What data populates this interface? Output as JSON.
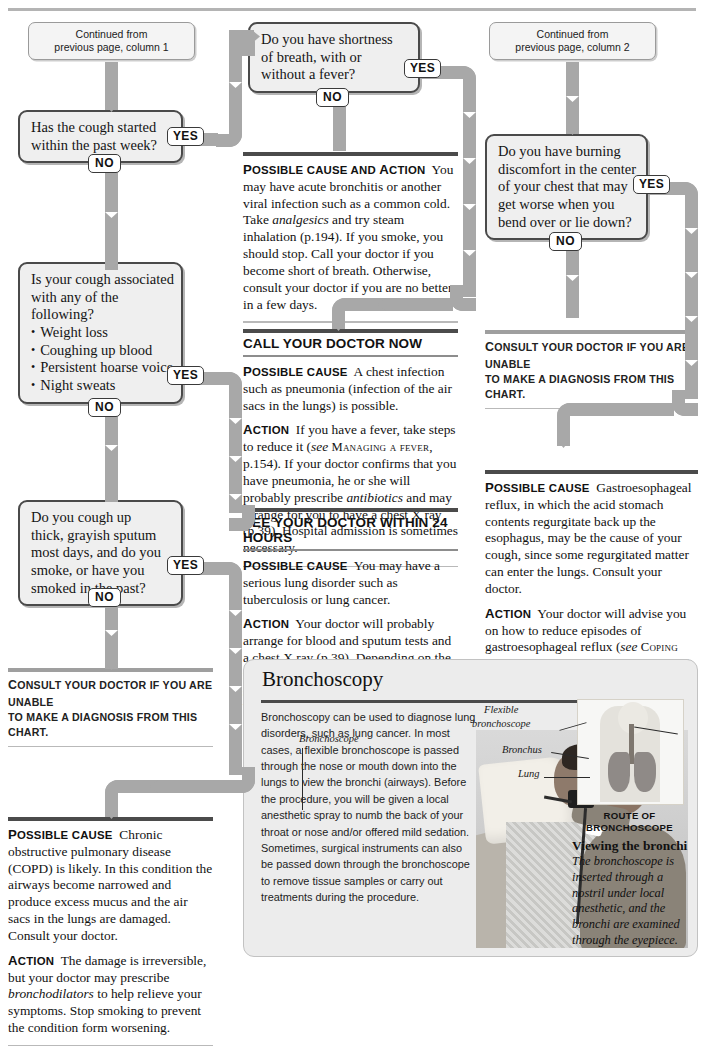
{
  "page": {
    "top_rule": true
  },
  "continued": [
    {
      "id": "col1",
      "line1": "Continued from",
      "line2": "previous page, column 1"
    },
    {
      "id": "col2",
      "line1": "Continued from",
      "line2": "previous page, column 2"
    }
  ],
  "labels": {
    "yes": "YES",
    "no": "NO"
  },
  "questions": [
    {
      "id": "q-cough-week",
      "lines": [
        "Has the cough started",
        "within the past week?"
      ],
      "yes": "YES",
      "no": "NO"
    },
    {
      "id": "q-shortness-breath",
      "lines": [
        "Do you have shortness",
        "of breath, with or",
        "without a fever?"
      ],
      "yes": "YES",
      "no": "NO"
    },
    {
      "id": "q-cough-associated",
      "lines": [
        "Is your cough associated",
        "with any of the",
        "following?"
      ],
      "bullets": [
        "Weight loss",
        "Coughing up blood",
        "Persistent hoarse voice",
        "Night sweats"
      ],
      "yes": "YES",
      "no": "NO"
    },
    {
      "id": "q-thick-sputum",
      "lines": [
        "Do you cough up",
        "thick, grayish sputum",
        "most days, and do you",
        "smoke, or have you",
        "smoked in the past?"
      ],
      "yes": "YES",
      "no": "NO"
    },
    {
      "id": "q-burning-discomfort",
      "lines": [
        "Do you have burning",
        "discomfort in the center",
        "of your chest that may",
        "get worse when you",
        "bend over or lie down?"
      ],
      "yes": "YES",
      "no": "NO"
    }
  ],
  "panels": {
    "acute_bronchitis": {
      "id": "panel-acute-bronchitis",
      "label": "Possible cause and action",
      "body": "You may have acute bronchitis or another viral infection such as a common cold. Take analgesics and try steam inhalation (p.194). If you smoke, you should stop. Call your doctor if you become short of breath. Otherwise, consult your doctor if you are no better in a few days.",
      "italics": [
        "analgesics"
      ]
    },
    "call_doctor_now": {
      "id": "panel-call-doctor-now",
      "banner": "CALL YOUR DOCTOR NOW",
      "cause_label": "Possible cause",
      "cause": "A chest infection such as pneumonia (infection of the air sacs in the lungs) is possible.",
      "action_label": "Action",
      "action": "If you have a fever, take steps to reduce it (see MANAGING A FEVER, p.154). If your doctor confirms that you have pneumonia, he or she will probably prescribe antibiotics and may arrange for you to have a chest X ray (p.39). Hospital admission is sometimes necessary.",
      "crossref": "MANAGING A FEVER",
      "italics": [
        "see",
        "antibiotics"
      ]
    },
    "see_doctor_24h": {
      "id": "panel-see-doctor-24-hours",
      "banner": "SEE YOUR DOCTOR WITHIN 24 HOURS",
      "cause_label": "Possible cause",
      "cause": "You may have a serious lung disorder such as tuberculosis or lung cancer.",
      "action_label": "Action",
      "action": "Your doctor will probably arrange for blood and sputum tests and a chest X ray (p.39). Depending on the results, you may then be referred to a specialist for tests such as bronchoscopy (below)."
    },
    "reflux": {
      "id": "panel-gastroesophageal-reflux",
      "cause_label": "Possible cause",
      "cause": "Gastroesophageal reflux, in which the acid stomach contents regurgitate back up the esophagus, may be the cause of your cough, since some regurgitated matter can enter the lungs. Consult your doctor.",
      "action_label": "Action",
      "action": "Your doctor will advise you on how to reduce episodes of gastroesophageal reflux (see COPING WITH GASTROESOPHAGEAL REFLUX, p.209). If the symptoms do not improve with these measures, your doctor may prescribe an ulcer-healing drug in order to reduce the production of stomach acid.",
      "crossref": "COPING WITH GASTROESOPHAGEAL REFLUX",
      "italics": [
        "see",
        "ulcer-healing drug"
      ]
    },
    "copd": {
      "id": "panel-copd",
      "cause_label": "Possible cause",
      "cause": "Chronic obstructive pulmonary disease (COPD) is likely. In this condition the airways become narrowed and produce excess mucus and the air sacs in the lungs are damaged. Consult your doctor.",
      "action_label": "Action",
      "action": "The damage is irreversible, but your doctor may prescribe bronchodilators to help relieve your symptoms. Stop smoking to prevent the condition form worsening.",
      "italics": [
        "bronchodilators"
      ]
    }
  },
  "consult_strips": [
    {
      "id": "consult-col1",
      "line1": "Consult your doctor if you are unable",
      "line2": "to make a diagnosis from this chart."
    },
    {
      "id": "consult-col3",
      "line1": "Consult your doctor if you are unable",
      "line2": "to make a diagnosis from this chart."
    }
  ],
  "bronchoscopy": {
    "title": "Bronchoscopy",
    "body": "Bronchoscopy can be used to diagnose lung disorders, such as lung cancer. In most cases, a flexible bronchoscope is passed through the nose or mouth down into the lungs to view the bronchi (airways). Before the procedure, you will be given a local anesthetic spray to numb the back of your throat or nose and/or offered mild sedation. Sometimes, surgical instruments can also be passed down through the bronchoscope to remove tissue samples or carry out treatments during the procedure.",
    "photo_labels": [
      {
        "id": "label-bronchoscope",
        "text": "Bronchoscope"
      },
      {
        "id": "label-flexible-bronchoscope",
        "text": "Flexible\nbronchoscope"
      },
      {
        "id": "label-bronchus",
        "text": "Bronchus"
      },
      {
        "id": "label-lung",
        "text": "Lung"
      }
    ],
    "flexible_label_l1": "Flexible",
    "flexible_label_l2": "bronchoscope",
    "bronchoscope_label": "Bronchoscope",
    "bronchus_label": "Bronchus",
    "lung_label": "Lung",
    "route_caption_l1": "ROUTE OF",
    "route_caption_l2": "BRONCHOSCOPE",
    "viewing_heading": "Viewing the bronchi",
    "viewing_body": "The bronchoscope is inserted through a nostril under local anesthetic, and the bronchi are examined through the eyepiece."
  },
  "colors": {
    "connector": "#a8a8a8",
    "box_fill": "#efefef",
    "box_border": "#4a4a4a",
    "rule_dark": "#4b4b4b",
    "rule_mid": "#9f9f9f",
    "feature_bg": "#ececec"
  }
}
